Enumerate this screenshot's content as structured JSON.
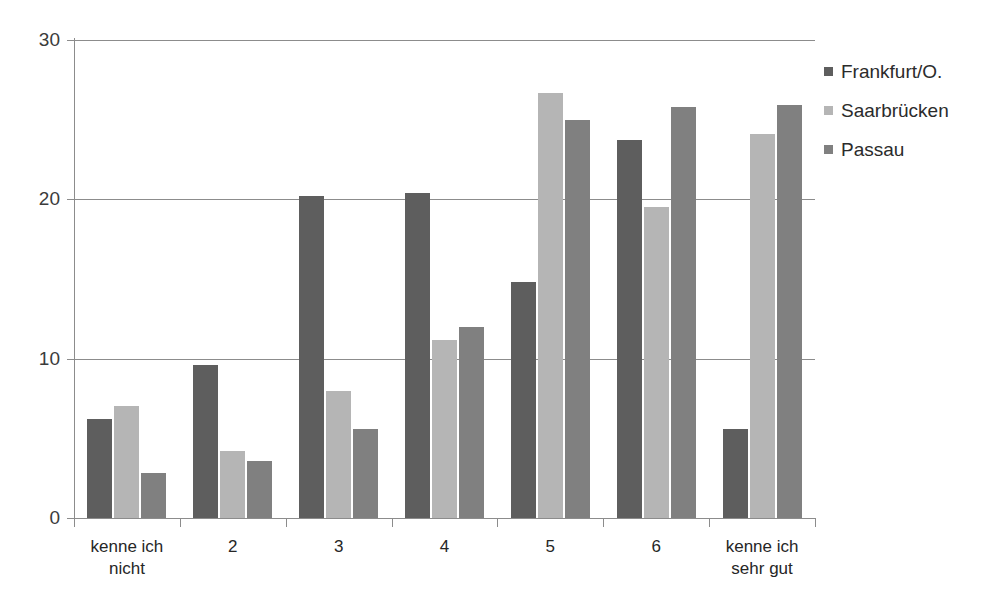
{
  "chart_data": {
    "type": "bar",
    "title": "",
    "subtitle": "",
    "xlabel": "",
    "ylabel": "",
    "categories": [
      "kenne ich\nnicht",
      "2",
      "3",
      "4",
      "5",
      "6",
      "kenne ich\nsehr gut"
    ],
    "series": [
      {
        "name": "Frankfurt/O.",
        "color": "#5e5e5e",
        "values": [
          6.2,
          9.6,
          20.2,
          20.4,
          14.8,
          23.7,
          5.6
        ]
      },
      {
        "name": "Saarbrücken",
        "color": "#b5b5b5",
        "values": [
          7.0,
          4.2,
          8.0,
          11.2,
          26.7,
          19.5,
          24.1
        ]
      },
      {
        "name": "Passau",
        "color": "#808080",
        "values": [
          2.8,
          3.6,
          5.6,
          12.0,
          25.0,
          25.8,
          25.9
        ]
      }
    ],
    "ylim": [
      0,
      30
    ],
    "yticks": [
      0,
      10,
      20,
      30
    ],
    "ytick_labels": [
      "0",
      "10",
      "20",
      "30"
    ],
    "grid": true,
    "legend_position": "right"
  },
  "legend": {
    "items": [
      {
        "label": "Frankfurt/O."
      },
      {
        "label": "Saarbrücken"
      },
      {
        "label": "Passau"
      }
    ]
  },
  "axis": {
    "y_tick_labels": [
      "30",
      "20",
      "10",
      "0"
    ]
  }
}
